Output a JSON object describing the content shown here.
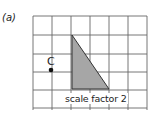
{
  "part_label": "(a)",
  "point_label": "C",
  "caption": "scale factor 2",
  "grid": {
    "cols": 6,
    "rows": 5,
    "origin_x": 33,
    "origin_y": 16,
    "cell": 19,
    "line_color": "#555555"
  },
  "triangle": {
    "vertices": [
      [
        2,
        1
      ],
      [
        2,
        4
      ],
      [
        4,
        4
      ]
    ],
    "fill": "#a6a6a6",
    "stroke": "#333333"
  },
  "center_point": {
    "col": 1,
    "row": 3,
    "color": "#111111"
  }
}
